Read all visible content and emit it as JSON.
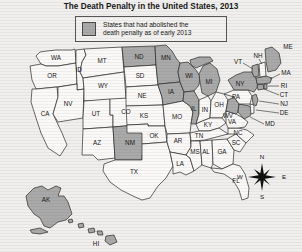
{
  "title": "The Death Penalty in the United States, 2013",
  "legend": {
    "swatch_color": "#a9a9a9",
    "line1": "States that had abolished the",
    "line2": "death penalty as of early 2013"
  },
  "compass": {
    "north": "N",
    "south": "S",
    "east": "E",
    "west": "W"
  },
  "colors": {
    "abolished_fill": "#a9a9a9",
    "retained_fill": "#faf9f7",
    "border": "#2b2b2b",
    "background": "#f0efed"
  },
  "map_data": {
    "type": "choropleth",
    "region": "United States",
    "categories": [
      "abolished",
      "retained"
    ],
    "states": [
      {
        "code": "WA",
        "abolished": false
      },
      {
        "code": "OR",
        "abolished": false
      },
      {
        "code": "CA",
        "abolished": false
      },
      {
        "code": "ID",
        "abolished": false
      },
      {
        "code": "NV",
        "abolished": false
      },
      {
        "code": "MT",
        "abolished": false
      },
      {
        "code": "WY",
        "abolished": false
      },
      {
        "code": "UT",
        "abolished": false
      },
      {
        "code": "AZ",
        "abolished": false
      },
      {
        "code": "CO",
        "abolished": false
      },
      {
        "code": "NM",
        "abolished": true
      },
      {
        "code": "ND",
        "abolished": true
      },
      {
        "code": "SD",
        "abolished": false
      },
      {
        "code": "NE",
        "abolished": false
      },
      {
        "code": "KS",
        "abolished": false
      },
      {
        "code": "OK",
        "abolished": false
      },
      {
        "code": "TX",
        "abolished": false
      },
      {
        "code": "MN",
        "abolished": true
      },
      {
        "code": "IA",
        "abolished": true
      },
      {
        "code": "MO",
        "abolished": false
      },
      {
        "code": "AR",
        "abolished": false
      },
      {
        "code": "LA",
        "abolished": false
      },
      {
        "code": "WI",
        "abolished": true
      },
      {
        "code": "IL",
        "abolished": true
      },
      {
        "code": "MI",
        "abolished": true
      },
      {
        "code": "IN",
        "abolished": false
      },
      {
        "code": "OH",
        "abolished": false
      },
      {
        "code": "KY",
        "abolished": false
      },
      {
        "code": "TN",
        "abolished": false
      },
      {
        "code": "MS",
        "abolished": false
      },
      {
        "code": "AL",
        "abolished": false
      },
      {
        "code": "GA",
        "abolished": false
      },
      {
        "code": "FL",
        "abolished": false
      },
      {
        "code": "SC",
        "abolished": false
      },
      {
        "code": "NC",
        "abolished": false
      },
      {
        "code": "VA",
        "abolished": false
      },
      {
        "code": "WV",
        "abolished": true
      },
      {
        "code": "MD",
        "abolished": true
      },
      {
        "code": "DE",
        "abolished": false
      },
      {
        "code": "PA",
        "abolished": false
      },
      {
        "code": "NJ",
        "abolished": true
      },
      {
        "code": "NY",
        "abolished": true
      },
      {
        "code": "CT",
        "abolished": true
      },
      {
        "code": "RI",
        "abolished": true
      },
      {
        "code": "MA",
        "abolished": true
      },
      {
        "code": "VT",
        "abolished": true
      },
      {
        "code": "NH",
        "abolished": false
      },
      {
        "code": "ME",
        "abolished": true
      },
      {
        "code": "AK",
        "abolished": true
      },
      {
        "code": "HI",
        "abolished": true
      }
    ]
  }
}
